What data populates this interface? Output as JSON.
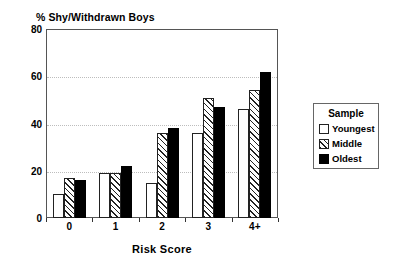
{
  "chart_data": {
    "type": "bar",
    "title": "% Shy/Withdrawn Boys",
    "xlabel": "Risk Score",
    "ylabel": "",
    "categories": [
      "0",
      "1",
      "2",
      "3",
      "4+"
    ],
    "series": [
      {
        "name": "Youngest",
        "values": [
          10,
          19,
          15,
          36,
          46
        ],
        "fill": "white"
      },
      {
        "name": "Middle",
        "values": [
          17,
          19,
          36,
          51,
          54
        ],
        "fill": "hatched"
      },
      {
        "name": "Oldest",
        "values": [
          16,
          22,
          38,
          47,
          62
        ],
        "fill": "black"
      }
    ],
    "ylim": [
      0,
      80
    ],
    "yticks": [
      0,
      20,
      40,
      60,
      80
    ],
    "grid": "horizontal-dotted",
    "legend": {
      "title": "Sample",
      "position": "right-outside",
      "entries": [
        "Youngest",
        "Middle",
        "Oldest"
      ]
    },
    "colors": {
      "axis": "#333333",
      "grid": "#bdbdbd",
      "bar_outline": "#222222",
      "oldest_fill": "#000000",
      "youngest_fill": "#ffffff",
      "background": "#ffffff"
    }
  }
}
